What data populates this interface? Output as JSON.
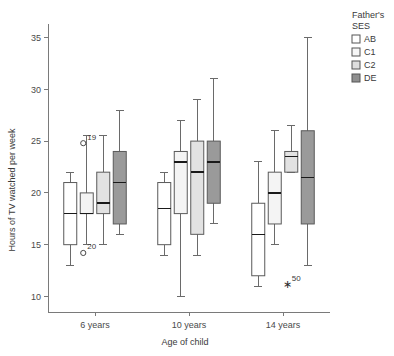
{
  "chart_data": {
    "type": "box",
    "title": "",
    "xlabel": "Age of child",
    "ylabel": "Hours of TV watched per week",
    "categories": [
      "6 years",
      "10 years",
      "14 years"
    ],
    "ylim": [
      8.5,
      36.5
    ],
    "yticks": [
      10,
      15,
      20,
      25,
      30,
      35
    ],
    "ytick_labels": [
      "10",
      "15",
      "20",
      "25",
      "30",
      "35"
    ],
    "grid": false,
    "legend_position": "right",
    "legend_title": "Father's SES",
    "series": [
      {
        "name": "AB",
        "color": "#ffffff",
        "boxes": [
          {
            "category": "6 years",
            "whisker_low": 13.0,
            "q1": 15.0,
            "median": 18.0,
            "q3": 21.0,
            "whisker_high": 22.0,
            "outliers": []
          },
          {
            "category": "10 years",
            "whisker_low": 14.0,
            "q1": 15.0,
            "median": 18.5,
            "q3": 21.0,
            "whisker_high": 22.0,
            "outliers": []
          },
          {
            "category": "14 years",
            "whisker_low": 11.0,
            "q1": 12.0,
            "median": 16.0,
            "q3": 19.0,
            "whisker_high": 23.0,
            "outliers": []
          }
        ]
      },
      {
        "name": "C1",
        "color": "#f4f4f4",
        "boxes": [
          {
            "category": "6 years",
            "whisker_low": 15.0,
            "q1": 18.0,
            "median": 18.0,
            "q3": 20.0,
            "whisker_high": 25.5,
            "outliers": [
              {
                "value": 24.8,
                "label": "19",
                "type": "mild"
              },
              {
                "value": 14.2,
                "label": "20",
                "type": "mild"
              }
            ]
          },
          {
            "category": "10 years",
            "whisker_low": 10.0,
            "q1": 18.0,
            "median": 23.0,
            "q3": 24.0,
            "whisker_high": 27.0,
            "outliers": []
          },
          {
            "category": "14 years",
            "whisker_low": 15.0,
            "q1": 17.0,
            "median": 20.0,
            "q3": 22.0,
            "whisker_high": 26.0,
            "outliers": []
          }
        ]
      },
      {
        "name": "C2",
        "color": "#e2e2e2",
        "boxes": [
          {
            "category": "6 years",
            "whisker_low": 15.0,
            "q1": 18.0,
            "median": 19.0,
            "q3": 22.0,
            "whisker_high": 25.5,
            "outliers": []
          },
          {
            "category": "10 years",
            "whisker_low": 14.0,
            "q1": 16.0,
            "median": 22.0,
            "q3": 25.0,
            "whisker_high": 29.0,
            "outliers": []
          },
          {
            "category": "14 years",
            "whisker_low": 22.0,
            "q1": 22.0,
            "median": 23.5,
            "q3": 24.0,
            "whisker_high": 26.5,
            "outliers": [
              {
                "value": 11.2,
                "label": "50",
                "type": "extreme"
              }
            ]
          }
        ]
      },
      {
        "name": "DE",
        "color": "#9a9a9a",
        "boxes": [
          {
            "category": "6 years",
            "whisker_low": 16.0,
            "q1": 17.0,
            "median": 21.0,
            "q3": 24.0,
            "whisker_high": 28.0,
            "outliers": []
          },
          {
            "category": "10 years",
            "whisker_low": 17.0,
            "q1": 19.0,
            "median": 23.0,
            "q3": 25.0,
            "whisker_high": 31.0,
            "outliers": []
          },
          {
            "category": "14 years",
            "whisker_low": 13.0,
            "q1": 17.0,
            "median": 21.5,
            "q3": 26.0,
            "whisker_high": 35.0,
            "outliers": []
          }
        ]
      }
    ]
  },
  "legend": {
    "title_line1": "Father's",
    "title_line2": "SES",
    "items": [
      {
        "label": "AB",
        "color": "#ffffff",
        "border": "#333333"
      },
      {
        "label": "C1",
        "color": "#f6f6f6",
        "border": "#777777"
      },
      {
        "label": "C2",
        "color": "#dedede",
        "border": "#777777"
      },
      {
        "label": "DE",
        "color": "#8f8f8f",
        "border": "#666666"
      }
    ]
  },
  "axes": {
    "y_title": "Hours of TV watched per week",
    "x_title": "Age of child"
  }
}
